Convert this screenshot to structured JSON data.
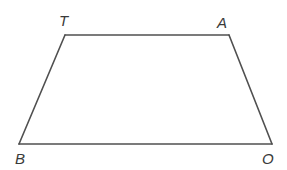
{
  "figure": {
    "type": "trapezoid",
    "stroke_color": "#505050",
    "label_color": "#3a3a3a",
    "vertices": [
      {
        "name": "T",
        "x": 65,
        "y": 35,
        "label_x": 59,
        "label_y": 26
      },
      {
        "name": "A",
        "x": 229,
        "y": 35,
        "label_x": 217,
        "label_y": 28
      },
      {
        "name": "O",
        "x": 272,
        "y": 144,
        "label_x": 262,
        "label_y": 164
      },
      {
        "name": "B",
        "x": 19,
        "y": 144,
        "label_x": 15,
        "label_y": 164
      }
    ],
    "edges": [
      {
        "from": "T",
        "to": "A"
      },
      {
        "from": "A",
        "to": "O"
      },
      {
        "from": "O",
        "to": "B"
      },
      {
        "from": "B",
        "to": "T"
      }
    ]
  },
  "labels": {
    "T": "T",
    "A": "A",
    "B": "B",
    "O": "O"
  }
}
